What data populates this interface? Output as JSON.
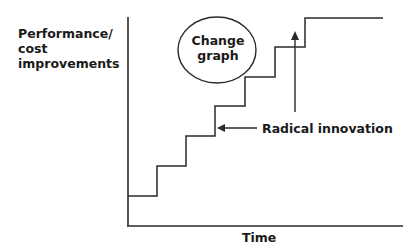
{
  "diagram": {
    "y_axis_label": [
      "Performance/",
      "cost",
      "improvements"
    ],
    "x_axis_label": "Time",
    "circle_label": [
      "Change",
      "graph"
    ],
    "annotation": "Radical innovation",
    "line_color": "#1a1a1a",
    "steps": 8
  }
}
